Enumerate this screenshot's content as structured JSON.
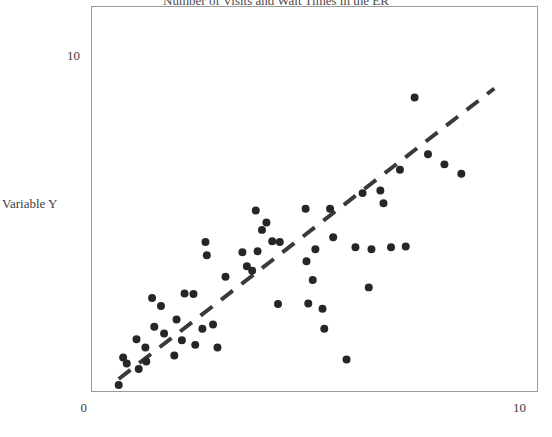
{
  "chart_data": {
    "type": "scatter",
    "title": "Number of Visits and Wait Times in the ER",
    "xlabel": "",
    "ylabel": "Variable Y",
    "xlim": [
      0,
      10
    ],
    "ylim": [
      0,
      10
    ],
    "grid": false,
    "legend": null,
    "x_ticks": [
      "0",
      "10"
    ],
    "x_tick_values": [
      0,
      10
    ],
    "y_ticks": [
      "10"
    ],
    "y_tick_values": [
      10
    ],
    "marker": {
      "shape": "circle",
      "color": "#262626",
      "size_px": 8
    },
    "trendline": {
      "style": "dashed",
      "color": "#3a3a3a",
      "width_px": 4,
      "x_start": 0.6,
      "y_start": 0.36,
      "x_end": 9.04,
      "y_end": 9.05
    },
    "points": [
      {
        "x": 0.6,
        "y": 0.18
      },
      {
        "x": 0.7,
        "y": 1.0
      },
      {
        "x": 0.78,
        "y": 0.82
      },
      {
        "x": 1.0,
        "y": 1.55
      },
      {
        "x": 1.05,
        "y": 0.66
      },
      {
        "x": 1.2,
        "y": 1.3
      },
      {
        "x": 1.22,
        "y": 0.88
      },
      {
        "x": 1.35,
        "y": 2.78
      },
      {
        "x": 1.4,
        "y": 1.92
      },
      {
        "x": 1.55,
        "y": 2.54
      },
      {
        "x": 1.62,
        "y": 1.72
      },
      {
        "x": 1.85,
        "y": 1.06
      },
      {
        "x": 1.9,
        "y": 2.14
      },
      {
        "x": 2.02,
        "y": 1.52
      },
      {
        "x": 2.08,
        "y": 2.92
      },
      {
        "x": 2.28,
        "y": 2.9
      },
      {
        "x": 2.32,
        "y": 1.38
      },
      {
        "x": 2.48,
        "y": 1.86
      },
      {
        "x": 2.55,
        "y": 4.46
      },
      {
        "x": 2.58,
        "y": 4.06
      },
      {
        "x": 2.72,
        "y": 1.99
      },
      {
        "x": 2.82,
        "y": 1.3
      },
      {
        "x": 3.0,
        "y": 3.42
      },
      {
        "x": 3.38,
        "y": 4.15
      },
      {
        "x": 3.48,
        "y": 3.73
      },
      {
        "x": 3.6,
        "y": 3.6
      },
      {
        "x": 3.68,
        "y": 5.4
      },
      {
        "x": 3.72,
        "y": 4.18
      },
      {
        "x": 3.82,
        "y": 4.82
      },
      {
        "x": 3.92,
        "y": 5.04
      },
      {
        "x": 4.05,
        "y": 4.48
      },
      {
        "x": 4.18,
        "y": 2.6
      },
      {
        "x": 4.22,
        "y": 4.46
      },
      {
        "x": 4.8,
        "y": 5.45
      },
      {
        "x": 4.82,
        "y": 3.88
      },
      {
        "x": 4.86,
        "y": 2.62
      },
      {
        "x": 4.96,
        "y": 3.32
      },
      {
        "x": 5.02,
        "y": 4.24
      },
      {
        "x": 5.18,
        "y": 2.46
      },
      {
        "x": 5.22,
        "y": 1.86
      },
      {
        "x": 5.35,
        "y": 5.45
      },
      {
        "x": 5.42,
        "y": 4.6
      },
      {
        "x": 5.72,
        "y": 0.94
      },
      {
        "x": 5.92,
        "y": 4.3
      },
      {
        "x": 6.08,
        "y": 5.92
      },
      {
        "x": 6.22,
        "y": 3.1
      },
      {
        "x": 6.28,
        "y": 4.24
      },
      {
        "x": 6.48,
        "y": 6.0
      },
      {
        "x": 6.55,
        "y": 5.62
      },
      {
        "x": 6.72,
        "y": 4.3
      },
      {
        "x": 6.92,
        "y": 6.62
      },
      {
        "x": 7.05,
        "y": 4.32
      },
      {
        "x": 7.25,
        "y": 8.78
      },
      {
        "x": 7.55,
        "y": 7.08
      },
      {
        "x": 7.92,
        "y": 6.78
      },
      {
        "x": 8.3,
        "y": 6.5
      }
    ]
  }
}
